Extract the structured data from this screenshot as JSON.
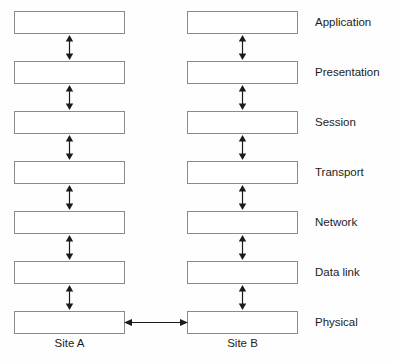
{
  "diagram": {
    "layers": [
      {
        "label": "Application",
        "top": 11
      },
      {
        "label": "Presentation",
        "top": 61
      },
      {
        "label": "Session",
        "top": 111
      },
      {
        "label": "Transport",
        "top": 161
      },
      {
        "label": "Network",
        "top": 211
      },
      {
        "label": "Data link",
        "top": 261
      },
      {
        "label": "Physical",
        "top": 311
      }
    ],
    "columns": [
      {
        "key": "col-a",
        "site_label": "Site A"
      },
      {
        "key": "col-b",
        "site_label": "Site B"
      }
    ],
    "vertical_arrows": [
      {
        "top": 35
      },
      {
        "top": 85
      },
      {
        "top": 135
      },
      {
        "top": 185
      },
      {
        "top": 235
      },
      {
        "top": 285
      }
    ],
    "horizontal_arrow": {
      "top": 317
    },
    "colors": {
      "box_border": "#8a8a8a",
      "box_fill": "#ffffff",
      "arrow": "#1a1a1a",
      "text": "#1c1c1c",
      "background": "#fefefe"
    }
  }
}
